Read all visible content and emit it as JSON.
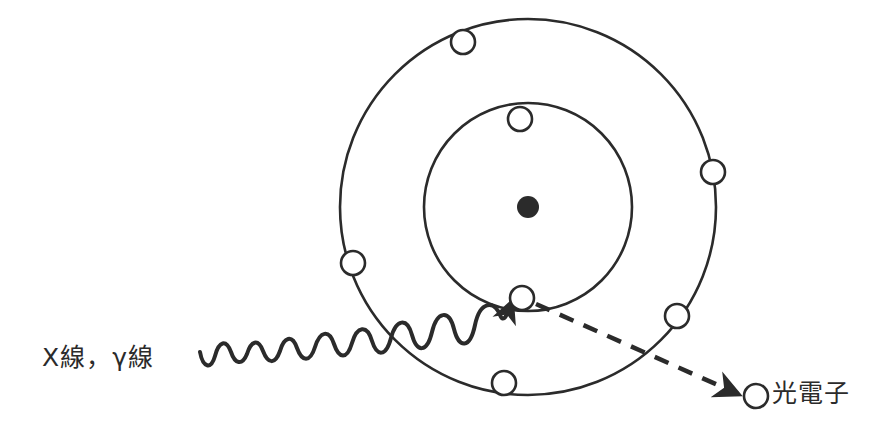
{
  "figure": {
    "title_text": "",
    "background_color": "#ffffff",
    "stroke_color": "#2b2b2b",
    "fill_color": "#ffffff",
    "width": 896,
    "height": 436
  },
  "labels": {
    "incident_radiation": "X線，γ線",
    "photoelectron": "光電子"
  },
  "atom": {
    "center_x": 528,
    "center_y": 207,
    "nucleus": {
      "name": "nucleus",
      "radius": 11,
      "fill": "#2b2b2b"
    },
    "shells": [
      {
        "name": "inner-shell",
        "radius": 104,
        "electron_count": 2
      },
      {
        "name": "outer-shell",
        "radius": 188,
        "electron_count": 5
      }
    ],
    "electron_radius": 12
  },
  "electrons": [
    {
      "name": "inner-electron-top",
      "shell": "inner",
      "x": 520,
      "y": 119
    },
    {
      "name": "inner-electron-struck",
      "shell": "inner",
      "x": 522,
      "y": 298
    },
    {
      "name": "outer-electron-top-left",
      "shell": "outer",
      "x": 463,
      "y": 42
    },
    {
      "name": "outer-electron-right",
      "shell": "outer",
      "x": 713,
      "y": 172
    },
    {
      "name": "outer-electron-left",
      "shell": "outer",
      "x": 353,
      "y": 263
    },
    {
      "name": "outer-electron-lower-right",
      "shell": "outer",
      "x": 677,
      "y": 316
    },
    {
      "name": "outer-electron-bottom",
      "shell": "outer",
      "x": 504,
      "y": 383
    },
    {
      "name": "ejected-photoelectron",
      "shell": "free",
      "x": 756,
      "y": 396
    }
  ],
  "incident_wave": {
    "name": "incident-photon-wave",
    "start_x": 200,
    "start_y": 352,
    "end_x": 512,
    "end_y": 300,
    "style": "sinusoid-with-arrow",
    "arrow": true
  },
  "ejection_path": {
    "name": "photoelectron-ejection-arrow",
    "start_x": 534,
    "start_y": 303,
    "end_x": 742,
    "end_y": 396,
    "style": "dashed-with-arrow",
    "arrow": true
  }
}
